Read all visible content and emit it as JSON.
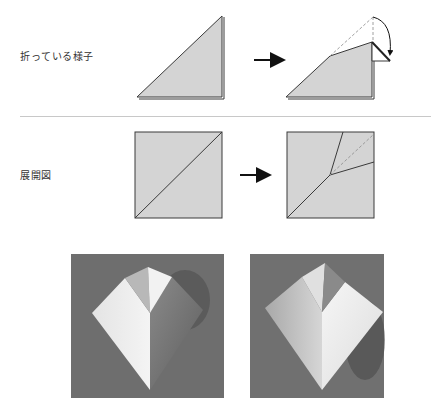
{
  "sections": {
    "folding": {
      "label": "折っている様子"
    },
    "crease_pattern": {
      "label": "展開図"
    }
  },
  "figures": {
    "step1_shape": "folded-triangle",
    "step2_shape": "triangle-with-reverse-fold",
    "crease1": "square-diagonal",
    "crease2": "square-diagonal-with-fold-lines",
    "photo1": "origami-kite-photo-front",
    "photo2": "origami-kite-photo-angle"
  },
  "icons": {
    "arrow_top": "right-arrow",
    "arrow_bottom": "right-arrow",
    "fold_arrow": "curved-fold-arrow"
  },
  "colors": {
    "paper_fill": "#d4d4d4",
    "line": "#3a3a3a",
    "dashed": "#9a9a9a",
    "photo_bg": "#6e6e6e",
    "divider": "#c8c8c8"
  }
}
